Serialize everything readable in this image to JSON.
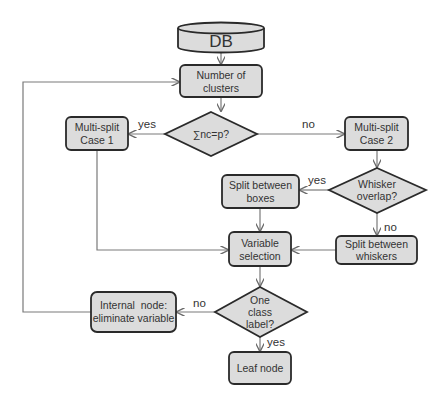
{
  "diagram": {
    "type": "flowchart",
    "colors": {
      "node_fill": "#dcdcdc",
      "node_stroke": "#2a2a2a",
      "edge": "#6a6a6a",
      "text": "#333333",
      "background": "#ffffff"
    },
    "nodes": {
      "db": {
        "shape": "cylinder",
        "label": "DB"
      },
      "number_of_clusters": {
        "shape": "rounded-rect",
        "line1": "Number of",
        "line2": "clusters"
      },
      "sum_nc_eq_p": {
        "shape": "diamond",
        "label": "∑nc=p?"
      },
      "multisplit_case1": {
        "shape": "rounded-rect",
        "line1": "Multi-split",
        "line2": "Case 1"
      },
      "multisplit_case2": {
        "shape": "rounded-rect",
        "line1": "Multi-split",
        "line2": "Case 2"
      },
      "whisker_overlap": {
        "shape": "diamond",
        "line1": "Whisker",
        "line2": "overlap?"
      },
      "split_between_boxes": {
        "shape": "rounded-rect",
        "line1": "Split between",
        "line2": "boxes"
      },
      "split_between_whiskers": {
        "shape": "rounded-rect",
        "line1": "Split between",
        "line2": "whiskers"
      },
      "variable_selection": {
        "shape": "rounded-rect",
        "line1": "Variable",
        "line2": "selection"
      },
      "one_class_label": {
        "shape": "diamond",
        "line1": "One",
        "line2": "class",
        "line3": "label?"
      },
      "internal_node": {
        "shape": "rounded-rect",
        "line1": "Internal  node:",
        "line2": "eliminate variable"
      },
      "leaf_node": {
        "shape": "rounded-rect",
        "label": "Leaf node"
      }
    },
    "edges": [
      {
        "from": "db",
        "to": "number_of_clusters",
        "label": ""
      },
      {
        "from": "number_of_clusters",
        "to": "sum_nc_eq_p",
        "label": ""
      },
      {
        "from": "sum_nc_eq_p",
        "to": "multisplit_case1",
        "label": "yes"
      },
      {
        "from": "sum_nc_eq_p",
        "to": "multisplit_case2",
        "label": "no"
      },
      {
        "from": "multisplit_case2",
        "to": "whisker_overlap",
        "label": ""
      },
      {
        "from": "whisker_overlap",
        "to": "split_between_boxes",
        "label": "yes"
      },
      {
        "from": "whisker_overlap",
        "to": "split_between_whiskers",
        "label": "no"
      },
      {
        "from": "multisplit_case1",
        "to": "variable_selection",
        "label": ""
      },
      {
        "from": "split_between_boxes",
        "to": "variable_selection",
        "label": ""
      },
      {
        "from": "split_between_whiskers",
        "to": "variable_selection",
        "label": ""
      },
      {
        "from": "variable_selection",
        "to": "one_class_label",
        "label": ""
      },
      {
        "from": "one_class_label",
        "to": "internal_node",
        "label": "no"
      },
      {
        "from": "one_class_label",
        "to": "leaf_node",
        "label": "yes"
      },
      {
        "from": "internal_node",
        "to": "number_of_clusters",
        "label": ""
      }
    ],
    "edge_labels": {
      "sum_yes": "yes",
      "sum_no": "no",
      "whisker_yes": "yes",
      "whisker_no": "no",
      "oneclass_no": "no",
      "oneclass_yes": "yes"
    }
  }
}
